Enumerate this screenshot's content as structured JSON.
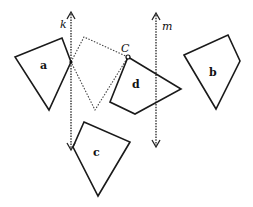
{
  "diagram": {
    "lines": [
      {
        "name": "k",
        "x": 71,
        "y_top": 12,
        "y_bottom": 150,
        "style": "dotted",
        "arrows": "both"
      },
      {
        "name": "m",
        "x": 156,
        "y_top": 13,
        "y_bottom": 147,
        "style": "dotted",
        "arrows": "both"
      }
    ],
    "shapes": [
      {
        "label": "a",
        "points": "15,57 62,38 71,62 49,110",
        "label_pos": [
          44,
          66
        ],
        "style": "solid"
      },
      {
        "label": "b",
        "points": "184,55 228,35 240,61 216,109",
        "label_pos": [
          213,
          73
        ],
        "style": "solid"
      },
      {
        "label": "c",
        "points": "84,122 130,142 98,196 73,147",
        "label_pos": [
          96,
          156
        ],
        "style": "solid"
      },
      {
        "label": "d",
        "points": "128,57 181,89 135,114 110,102",
        "label_pos": [
          136,
          86
        ],
        "style": "solid"
      },
      {
        "label": "",
        "points": "71,62 84,37 128,57 95,110",
        "style": "dashed"
      }
    ],
    "point": {
      "label": "C",
      "x": 128,
      "y": 57,
      "label_pos": [
        122,
        52
      ]
    },
    "labels": {
      "k": "k",
      "m": "m",
      "a": "a",
      "b": "b",
      "c": "c",
      "d": "d",
      "C": "C"
    },
    "colors": {
      "stroke": "#1a1a1a",
      "background": "#ffffff"
    }
  }
}
